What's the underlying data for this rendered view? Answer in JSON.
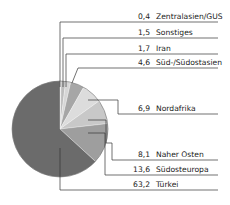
{
  "chart_data": {
    "type": "pie",
    "title": "",
    "unit": "%",
    "start_angle": "top, clockwise",
    "slices": [
      {
        "label": "Zentralasien/GUS",
        "value_text": "0,4",
        "value": 0.4,
        "color": "#e6e6e6",
        "label_y": 22,
        "leader_x": 60
      },
      {
        "label": "Sonstiges",
        "value_text": "1,5",
        "value": 1.5,
        "color": "#bdbdbd",
        "label_y": 38,
        "leader_x": 63
      },
      {
        "label": "Iran",
        "value_text": "1,7",
        "value": 1.7,
        "color": "#d6d6d6",
        "label_y": 54,
        "leader_x": 66
      },
      {
        "label": "Süd-/Südostasien",
        "value_text": "4,6",
        "value": 4.6,
        "color": "#a6a6a6",
        "label_y": 68,
        "leader_x": 0
      },
      {
        "label": "Nordafrika",
        "value_text": "6,9",
        "value": 6.9,
        "color": "#dcdcdc",
        "label_y": 114,
        "leader_x": 118
      },
      {
        "label": "Naher Osten",
        "value_text": "8,1",
        "value": 8.1,
        "color": "#c8c8c8",
        "label_y": 160,
        "leader_x": 112
      },
      {
        "label": "Südosteuropa",
        "value_text": "13,6",
        "value": 13.6,
        "color": "#9e9e9e",
        "label_y": 175,
        "leader_x": 105
      },
      {
        "label": "Türkei",
        "value_text": "63,2",
        "value": 63.2,
        "color": "#6b6b6b",
        "label_y": 190,
        "leader_x": 60
      }
    ]
  }
}
